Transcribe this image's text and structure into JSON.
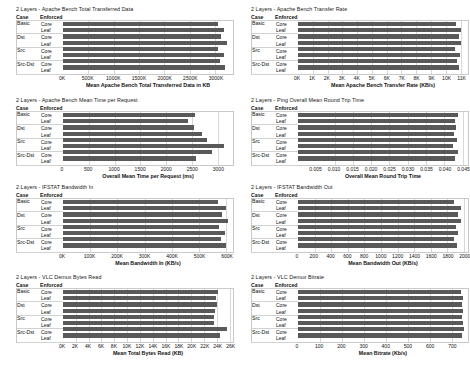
{
  "table_headers": {
    "case": "Case",
    "enforced": "Enforced"
  },
  "cases": [
    "Basic",
    "Dst",
    "Src",
    "Src-Dst"
  ],
  "enforced": [
    "Core",
    "Leaf"
  ],
  "footer_fragment": "",
  "colors": {
    "bar": "#595959",
    "grid": "#d8d8d8",
    "text": "#111111"
  },
  "chart_data": [
    {
      "id": "apache-bench-total-transferred-data",
      "type": "bar",
      "orientation": "horizontal",
      "title": "2 Layers - Apache Bench Total Transferred Data",
      "xlabel": "Mean Apache Bench Total Transferred Data in KB",
      "ylabel": "",
      "categories": [
        "Basic Core",
        "Basic Leaf",
        "Dst Core",
        "Dst Leaf",
        "Src Core",
        "Src Leaf",
        "Src-Dst Core",
        "Src-Dst Leaf"
      ],
      "values": [
        3050000,
        3180000,
        3120000,
        3230000,
        3060000,
        3180000,
        3090000,
        3200000
      ],
      "ticks": [
        "0K",
        "500K",
        "1000K",
        "1500K",
        "2000K",
        "2500K",
        "3000K"
      ],
      "tickvals": [
        0,
        500000,
        1000000,
        1500000,
        2000000,
        2500000,
        3000000
      ],
      "xlim": [
        0,
        3350000
      ],
      "grid": true,
      "legend": "none"
    },
    {
      "id": "apache-bench-transfer-rate",
      "type": "bar",
      "orientation": "horizontal",
      "title": "2 Layers - Apache Bench Transfer Rate",
      "xlabel": "Mean Apache Bench Transfer Rate (KB/s)",
      "ylabel": "",
      "categories": [
        "Basic Core",
        "Basic Leaf",
        "Dst Core",
        "Dst Leaf",
        "Src Core",
        "Src Leaf",
        "Src-Dst Core",
        "Src-Dst Leaf"
      ],
      "values": [
        10700,
        11000,
        10900,
        11050,
        10600,
        10950,
        10750,
        10900
      ],
      "ticks": [
        "0K",
        "1K",
        "2K",
        "3K",
        "4K",
        "5K",
        "6K",
        "7K",
        "8K",
        "9K",
        "10K",
        "11K"
      ],
      "tickvals": [
        0,
        1000,
        2000,
        3000,
        4000,
        5000,
        6000,
        7000,
        8000,
        9000,
        10000,
        11000
      ],
      "xlim": [
        0,
        11500
      ],
      "grid": true,
      "legend": "none"
    },
    {
      "id": "apache-bench-mean-time-per-request",
      "type": "bar",
      "orientation": "horizontal",
      "title": "2 Layers - Apache Bench Mean Time per Request",
      "xlabel": "Overall Mean Time per Request (ms)",
      "ylabel": "",
      "categories": [
        "Basic Core",
        "Basic Leaf",
        "Dst Core",
        "Dst Leaf",
        "Src Core",
        "Src Leaf",
        "Src-Dst Core",
        "Src-Dst Leaf"
      ],
      "values": [
        2560,
        2420,
        2540,
        2700,
        2790,
        3120,
        2900,
        2590
      ],
      "ticks": [
        "0",
        "500",
        "1000",
        "1500",
        "2000",
        "2500",
        "3000"
      ],
      "tickvals": [
        0,
        500,
        1000,
        1500,
        2000,
        2500,
        3000
      ],
      "xlim": [
        0,
        3300
      ],
      "grid": true,
      "legend": "none"
    },
    {
      "id": "ping-overall-mean-round-trip-time",
      "type": "bar",
      "orientation": "horizontal",
      "title": "2 Layers - Ping Overall Mean Round Trip Time",
      "xlabel": "Overall Mean Round Trip Time",
      "ylabel": "",
      "categories": [
        "Basic Core",
        "Basic Leaf",
        "Dst Core",
        "Dst Leaf",
        "Src Core",
        "Src Leaf",
        "Src-Dst Core",
        "Src-Dst Leaf"
      ],
      "values": [
        0.0438,
        0.043,
        0.0432,
        0.0428,
        0.0436,
        0.0424,
        0.0438,
        0.043
      ],
      "ticks": [
        "0.005",
        "0.010",
        "0.015",
        "0.020",
        "0.025",
        "0.030",
        "0.035",
        "0.040",
        "0.045"
      ],
      "tickvals": [
        0.005,
        0.01,
        0.015,
        0.02,
        0.025,
        0.03,
        0.035,
        0.04,
        0.045
      ],
      "xlim": [
        0.0,
        0.0465
      ],
      "grid": true,
      "legend": "none"
    },
    {
      "id": "ifstat-bandwidth-in",
      "type": "bar",
      "orientation": "horizontal",
      "title": "2 Layers - IFSTAT Bandwidth In",
      "xlabel": "Mean Bandwidth In (KB/s)",
      "ylabel": "",
      "categories": [
        "Basic Core",
        "Basic Leaf",
        "Dst Core",
        "Dst Leaf",
        "Src Core",
        "Src Leaf",
        "Src-Dst Core",
        "Src-Dst Leaf"
      ],
      "values": [
        570000,
        600000,
        585000,
        605000,
        575000,
        595000,
        580000,
        598000
      ],
      "ticks": [
        "0K",
        "100K",
        "200K",
        "300K",
        "400K",
        "500K",
        "600K"
      ],
      "tickvals": [
        0,
        100000,
        200000,
        300000,
        400000,
        500000,
        600000
      ],
      "xlim": [
        0,
        625000
      ],
      "grid": true,
      "legend": "none"
    },
    {
      "id": "ifstat-bandwidth-out",
      "type": "bar",
      "orientation": "horizontal",
      "title": "2 Layers - IFSTAT Bandwidth Out",
      "xlabel": "Mean Bandwidth Out (KB/s)",
      "ylabel": "",
      "categories": [
        "Basic Core",
        "Basic Leaf",
        "Dst Core",
        "Dst Leaf",
        "Src Core",
        "Src Leaf",
        "Src-Dst Core",
        "Src-Dst Leaf"
      ],
      "values": [
        1880,
        1960,
        1930,
        1960,
        1900,
        1930,
        1880,
        1920
      ],
      "ticks": [
        "0",
        "200",
        "400",
        "600",
        "800",
        "1000",
        "1200",
        "1400",
        "1600",
        "1800",
        "2000"
      ],
      "tickvals": [
        0,
        200,
        400,
        600,
        800,
        1000,
        1200,
        1400,
        1600,
        1800,
        2000
      ],
      "xlim": [
        0,
        2050
      ],
      "grid": true,
      "legend": "none"
    },
    {
      "id": "vlc-demux-bytes-read",
      "type": "bar",
      "orientation": "horizontal",
      "title": "2 Layers - VLC Demux Bytes Read",
      "xlabel": "Mean Total Bytes Read (KB)",
      "ylabel": "",
      "categories": [
        "Basic Core",
        "Basic Leaf",
        "Dst Core",
        "Dst Leaf",
        "Src Core",
        "Src Leaf",
        "Src-Dst Core",
        "Src-Dst Leaf"
      ],
      "values": [
        24200,
        23800,
        24000,
        23700,
        23500,
        23600,
        25600,
        24500
      ],
      "ticks": [
        "0K",
        "2K",
        "4K",
        "6K",
        "8K",
        "10K",
        "12K",
        "14K",
        "16K",
        "18K",
        "20K",
        "22K",
        "24K",
        "26K"
      ],
      "tickvals": [
        0,
        2000,
        4000,
        6000,
        8000,
        10000,
        12000,
        14000,
        16000,
        18000,
        20000,
        22000,
        24000,
        26000
      ],
      "xlim": [
        0,
        26500
      ],
      "grid": true,
      "legend": "none"
    },
    {
      "id": "vlc-demux-bitrate",
      "type": "bar",
      "orientation": "horizontal",
      "title": "2 Layers - VLC Demux Bitrate",
      "xlabel": "Mean Bitrate (Kb/s)",
      "ylabel": "",
      "categories": [
        "Basic Core",
        "Basic Leaf",
        "Dst Core",
        "Dst Leaf",
        "Src Core",
        "Src Leaf",
        "Src-Dst Core",
        "Src-Dst Leaf"
      ],
      "values": [
        745,
        752,
        748,
        750,
        746,
        752,
        755,
        748
      ],
      "ticks": [
        "0",
        "100",
        "200",
        "300",
        "400",
        "500",
        "600",
        "700"
      ],
      "tickvals": [
        0,
        100,
        200,
        300,
        400,
        500,
        600,
        700
      ],
      "xlim": [
        0,
        775
      ],
      "grid": true,
      "legend": "none"
    }
  ]
}
